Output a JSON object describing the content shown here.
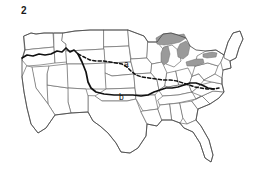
{
  "figure": {
    "number": "2",
    "kind": "map-figure",
    "background_color": "#ffffff"
  },
  "map": {
    "title": "2",
    "region": "Contiguous United States",
    "state_boundary_color": "#6b6b6b",
    "coastline_color": "#4a4a4a",
    "lake_fill_color": "#9a9a9a",
    "annotation_color": "#111111"
  },
  "annotations": [
    {
      "id": "a",
      "label": "a",
      "style": "dashed",
      "description": "Dashed boundary line running from the Pacific Northwest east across the northern plains and Midwest to the mid-Atlantic",
      "label_x": 124,
      "label_y": 67
    },
    {
      "id": "b",
      "label": "b",
      "style": "solid",
      "description": "Thick solid boundary line running from the Pacific Northwest coast southeast across the central plains to the southeastern seaboard",
      "label_x": 122,
      "label_y": 99
    }
  ],
  "lakes": {
    "name": "Great Lakes",
    "fill": "#9a9a9a"
  }
}
